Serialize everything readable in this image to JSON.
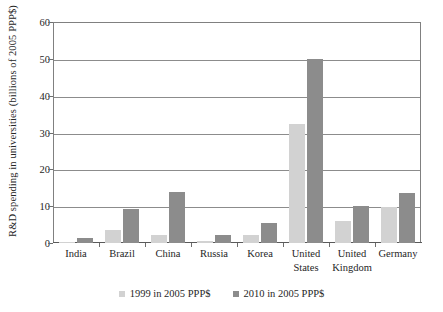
{
  "chart_data": {
    "type": "bar",
    "title": "",
    "xlabel": "",
    "ylabel": "R&D spending in universities (billions of 2005 PPP$)",
    "ylim": [
      0,
      60
    ],
    "yticks": [
      0,
      10,
      20,
      30,
      40,
      50,
      60
    ],
    "grid": true,
    "legend_position": "bottom",
    "categories": [
      "India",
      "Brazil",
      "China",
      "Russia",
      "Korea",
      "United States",
      "United Kingdom",
      "Germany"
    ],
    "category_lines": [
      [
        "India"
      ],
      [
        "Brazil"
      ],
      [
        "China"
      ],
      [
        "Russia"
      ],
      [
        "Korea"
      ],
      [
        "United",
        "States"
      ],
      [
        "United",
        "Kingdom"
      ],
      [
        "Germany"
      ]
    ],
    "series": [
      {
        "name": "1999 in 2005 PPP$",
        "color": "#d2d2d2",
        "values": [
          0.3,
          3.4,
          2.3,
          0.5,
          2.3,
          32.4,
          6.1,
          9.9
        ]
      },
      {
        "name": "2010 in 2005 PPP$",
        "color": "#8c8c8c",
        "values": [
          1.3,
          9.2,
          13.8,
          2.1,
          5.4,
          50.0,
          10.1,
          13.5
        ]
      }
    ]
  },
  "axis": {
    "tick_labels": [
      "0",
      "10",
      "20",
      "30",
      "40",
      "50",
      "60"
    ]
  },
  "colors": {
    "series_1999": "#d2d2d2",
    "series_2010": "#8c8c8c",
    "gridline": "#8c8c8c",
    "frame": "#808080",
    "text": "#262626",
    "background": "#ffffff"
  }
}
